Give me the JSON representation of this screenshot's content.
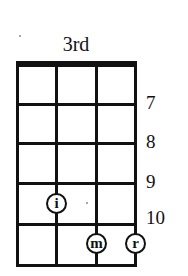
{
  "diagram": {
    "position_label": "3rd",
    "strings": 4,
    "fret_numbers": [
      "7",
      "8",
      "9",
      "10"
    ],
    "fingers": [
      {
        "label": "i",
        "string": 2,
        "fret_row": 4
      },
      {
        "label": "m",
        "string": 3,
        "fret_row": 5
      },
      {
        "label": "r",
        "string": 4,
        "fret_row": 5
      }
    ],
    "colors": {
      "ink": "#111111",
      "background": "#ffffff"
    }
  }
}
